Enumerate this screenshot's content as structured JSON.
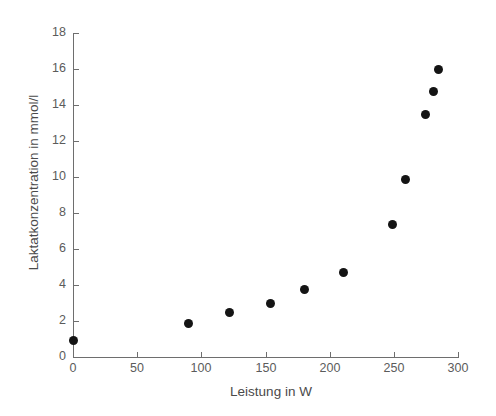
{
  "chart_data": {
    "type": "scatter",
    "title": "",
    "xlabel": "Leistung in W",
    "ylabel": "Laktatkonzentration in mmol/l",
    "xlim": [
      0,
      300
    ],
    "ylim": [
      0,
      18
    ],
    "xticks": [
      0,
      50,
      100,
      150,
      200,
      250,
      300
    ],
    "yticks": [
      0,
      2,
      4,
      6,
      8,
      10,
      12,
      14,
      16,
      18
    ],
    "xtick_labels": [
      "0",
      "50",
      "100",
      "150",
      "200",
      "250",
      "300"
    ],
    "ytick_labels": [
      "0",
      "2",
      "4",
      "6",
      "8",
      "10",
      "12",
      "14",
      "16",
      "18"
    ],
    "grid": false,
    "legend": null,
    "marker": "filled-circle",
    "marker_color": "#141414",
    "axis_color": "#6e6e6e",
    "background_color": "#ffffff",
    "series": [
      {
        "name": "Laktat",
        "x": [
          0,
          90,
          122,
          154,
          180,
          211,
          249,
          259,
          275,
          281,
          285
        ],
        "y": [
          0.9,
          1.85,
          2.45,
          2.95,
          3.75,
          4.7,
          7.35,
          9.85,
          13.5,
          14.75,
          16.0
        ]
      }
    ]
  }
}
